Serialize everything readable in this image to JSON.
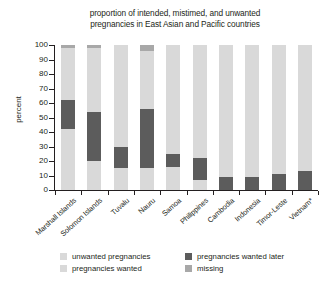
{
  "chart_data": {
    "type": "bar",
    "subtype": "stacked-bar-100-percent",
    "title": "proportion of intended, mistimed, and unwanted pregnancies in East Asian and Pacific countries",
    "title_lines": [
      "proportion of intended, mistimed, and unwanted",
      "pregnancies in East Asian and Pacific countries"
    ],
    "xlabel": "",
    "ylabel": "percent",
    "ylim": [
      0,
      100
    ],
    "yticks": [
      0,
      10,
      20,
      30,
      40,
      50,
      60,
      70,
      80,
      90,
      100
    ],
    "ytick_labels": [
      "0",
      "10",
      "20",
      "30",
      "40",
      "50",
      "60",
      "70",
      "80",
      "90",
      "100"
    ],
    "grid": false,
    "legend_position": "bottom",
    "categories": [
      "Marshall Islands",
      "Solomon Islands",
      "Tuvalu",
      "Nauru",
      "Samoa",
      "Philippines",
      "Cambodia",
      "Indonesia",
      "Timor-Leste",
      "Vietnam*"
    ],
    "series": [
      {
        "name": "unwanted pregnancies",
        "color": "#5c5c5c",
        "values": [
          0,
          0,
          0,
          0,
          0,
          0,
          9,
          9,
          11,
          13
        ]
      },
      {
        "name": "pregnancies wanted later",
        "color": "#5c5c5c",
        "values": [
          20,
          34,
          15,
          41,
          9,
          15,
          0,
          0,
          0,
          0
        ]
      },
      {
        "name": "pregnancies wanted",
        "color": "#d9d9d9",
        "values": [
          78,
          64,
          85,
          55,
          91,
          85,
          91,
          91,
          89,
          87
        ]
      },
      {
        "name": "missing",
        "color": "#a8a8a8",
        "values": [
          2,
          2,
          0,
          4,
          0,
          0,
          0,
          0,
          0,
          0
        ]
      }
    ],
    "bars": [
      {
        "category": "Marshall Islands",
        "segments": [
          {
            "name": "pregnancies wanted",
            "from": 0,
            "to": 42,
            "color": "#d9d9d9"
          },
          {
            "name": "pregnancies wanted later",
            "from": 42,
            "to": 62,
            "color": "#5c5c5c"
          },
          {
            "name": "pregnancies wanted",
            "from": 62,
            "to": 98,
            "color": "#d9d9d9"
          },
          {
            "name": "missing",
            "from": 98,
            "to": 100,
            "color": "#a8a8a8"
          }
        ]
      },
      {
        "category": "Solomon Islands",
        "segments": [
          {
            "name": "pregnancies wanted",
            "from": 0,
            "to": 20,
            "color": "#d9d9d9"
          },
          {
            "name": "pregnancies wanted later",
            "from": 20,
            "to": 54,
            "color": "#5c5c5c"
          },
          {
            "name": "pregnancies wanted",
            "from": 54,
            "to": 98,
            "color": "#d9d9d9"
          },
          {
            "name": "missing",
            "from": 98,
            "to": 100,
            "color": "#a8a8a8"
          }
        ]
      },
      {
        "category": "Tuvalu",
        "segments": [
          {
            "name": "pregnancies wanted",
            "from": 0,
            "to": 15,
            "color": "#d9d9d9"
          },
          {
            "name": "pregnancies wanted later",
            "from": 15,
            "to": 30,
            "color": "#5c5c5c"
          },
          {
            "name": "pregnancies wanted",
            "from": 30,
            "to": 100,
            "color": "#d9d9d9"
          }
        ]
      },
      {
        "category": "Nauru",
        "segments": [
          {
            "name": "pregnancies wanted",
            "from": 0,
            "to": 15,
            "color": "#d9d9d9"
          },
          {
            "name": "pregnancies wanted later",
            "from": 15,
            "to": 56,
            "color": "#5c5c5c"
          },
          {
            "name": "pregnancies wanted",
            "from": 56,
            "to": 96,
            "color": "#d9d9d9"
          },
          {
            "name": "missing",
            "from": 96,
            "to": 100,
            "color": "#a8a8a8"
          }
        ]
      },
      {
        "category": "Samoa",
        "segments": [
          {
            "name": "pregnancies wanted",
            "from": 0,
            "to": 16,
            "color": "#d9d9d9"
          },
          {
            "name": "pregnancies wanted later",
            "from": 16,
            "to": 25,
            "color": "#5c5c5c"
          },
          {
            "name": "pregnancies wanted",
            "from": 25,
            "to": 100,
            "color": "#d9d9d9"
          }
        ]
      },
      {
        "category": "Philippines",
        "segments": [
          {
            "name": "pregnancies wanted",
            "from": 0,
            "to": 7,
            "color": "#d9d9d9"
          },
          {
            "name": "pregnancies wanted later",
            "from": 7,
            "to": 22,
            "color": "#5c5c5c"
          },
          {
            "name": "pregnancies wanted",
            "from": 22,
            "to": 100,
            "color": "#d9d9d9"
          }
        ]
      },
      {
        "category": "Cambodia",
        "segments": [
          {
            "name": "unwanted pregnancies",
            "from": 0,
            "to": 9,
            "color": "#5c5c5c"
          },
          {
            "name": "pregnancies wanted",
            "from": 9,
            "to": 100,
            "color": "#d9d9d9"
          }
        ]
      },
      {
        "category": "Indonesia",
        "segments": [
          {
            "name": "unwanted pregnancies",
            "from": 0,
            "to": 9,
            "color": "#5c5c5c"
          },
          {
            "name": "pregnancies wanted",
            "from": 9,
            "to": 100,
            "color": "#d9d9d9"
          }
        ]
      },
      {
        "category": "Timor-Leste",
        "segments": [
          {
            "name": "unwanted pregnancies",
            "from": 0,
            "to": 11,
            "color": "#5c5c5c"
          },
          {
            "name": "pregnancies wanted",
            "from": 11,
            "to": 100,
            "color": "#d9d9d9"
          }
        ]
      },
      {
        "category": "Vietnam*",
        "segments": [
          {
            "name": "unwanted pregnancies",
            "from": 0,
            "to": 13,
            "color": "#5c5c5c"
          },
          {
            "name": "pregnancies wanted",
            "from": 13,
            "to": 100,
            "color": "#d9d9d9"
          }
        ]
      }
    ],
    "legend": [
      {
        "label": "unwanted pregnancies",
        "color": "#d9d9d9"
      },
      {
        "label": "pregnancies wanted later",
        "color": "#5c5c5c"
      },
      {
        "label": "pregnancies wanted",
        "color": "#d9d9d9"
      },
      {
        "label": "missing",
        "color": "#a8a8a8"
      }
    ]
  },
  "colors": {
    "axis": "#231f20",
    "text": "#231f20",
    "light_gray": "#d9d9d9",
    "mid_gray": "#a8a8a8",
    "dark_gray": "#5c5c5c",
    "background": "#ffffff"
  }
}
